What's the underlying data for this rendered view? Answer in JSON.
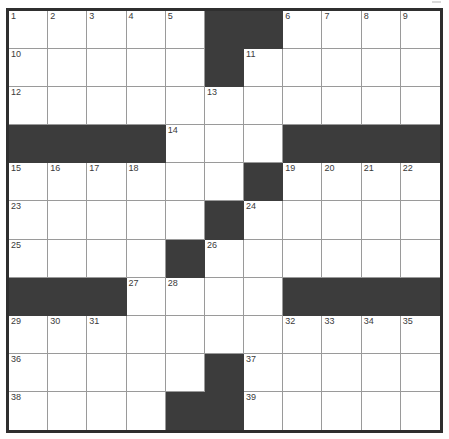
{
  "puzzle": {
    "title": "Crossword Grid",
    "columns": 11,
    "rows": 11,
    "colors": {
      "block": "#3c3c3c",
      "open": "#ffffff",
      "frame": "#2f2f2f",
      "gridline": "#9a9a9a",
      "number_text": "#3a3a3a"
    },
    "legend": {
      "block_label": "block",
      "open_label": "open"
    },
    "grid": [
      [
        {
          "type": "open",
          "number": "1"
        },
        {
          "type": "open",
          "number": "2"
        },
        {
          "type": "open",
          "number": "3"
        },
        {
          "type": "open",
          "number": "4"
        },
        {
          "type": "open",
          "number": "5"
        },
        {
          "type": "block",
          "number": ""
        },
        {
          "type": "block",
          "number": ""
        },
        {
          "type": "open",
          "number": "6"
        },
        {
          "type": "open",
          "number": "7"
        },
        {
          "type": "open",
          "number": "8"
        },
        {
          "type": "open",
          "number": "9"
        }
      ],
      [
        {
          "type": "open",
          "number": "10"
        },
        {
          "type": "open",
          "number": ""
        },
        {
          "type": "open",
          "number": ""
        },
        {
          "type": "open",
          "number": ""
        },
        {
          "type": "open",
          "number": ""
        },
        {
          "type": "block",
          "number": ""
        },
        {
          "type": "open",
          "number": "11"
        },
        {
          "type": "open",
          "number": ""
        },
        {
          "type": "open",
          "number": ""
        },
        {
          "type": "open",
          "number": ""
        },
        {
          "type": "open",
          "number": ""
        }
      ],
      [
        {
          "type": "open",
          "number": "12"
        },
        {
          "type": "open",
          "number": ""
        },
        {
          "type": "open",
          "number": ""
        },
        {
          "type": "open",
          "number": ""
        },
        {
          "type": "open",
          "number": ""
        },
        {
          "type": "open",
          "number": "13"
        },
        {
          "type": "open",
          "number": ""
        },
        {
          "type": "open",
          "number": ""
        },
        {
          "type": "open",
          "number": ""
        },
        {
          "type": "open",
          "number": ""
        },
        {
          "type": "open",
          "number": ""
        }
      ],
      [
        {
          "type": "block",
          "number": ""
        },
        {
          "type": "block",
          "number": ""
        },
        {
          "type": "block",
          "number": ""
        },
        {
          "type": "block",
          "number": ""
        },
        {
          "type": "open",
          "number": "14"
        },
        {
          "type": "open",
          "number": ""
        },
        {
          "type": "open",
          "number": ""
        },
        {
          "type": "block",
          "number": ""
        },
        {
          "type": "block",
          "number": ""
        },
        {
          "type": "block",
          "number": ""
        },
        {
          "type": "block",
          "number": ""
        }
      ],
      [
        {
          "type": "open",
          "number": "15"
        },
        {
          "type": "open",
          "number": "16"
        },
        {
          "type": "open",
          "number": "17"
        },
        {
          "type": "open",
          "number": "18"
        },
        {
          "type": "open",
          "number": ""
        },
        {
          "type": "open",
          "number": ""
        },
        {
          "type": "block",
          "number": ""
        },
        {
          "type": "open",
          "number": "19"
        },
        {
          "type": "open",
          "number": "20"
        },
        {
          "type": "open",
          "number": "21"
        },
        {
          "type": "open",
          "number": "22"
        }
      ],
      [
        {
          "type": "open",
          "number": "23"
        },
        {
          "type": "open",
          "number": ""
        },
        {
          "type": "open",
          "number": ""
        },
        {
          "type": "open",
          "number": ""
        },
        {
          "type": "open",
          "number": ""
        },
        {
          "type": "block",
          "number": ""
        },
        {
          "type": "open",
          "number": "24"
        },
        {
          "type": "open",
          "number": ""
        },
        {
          "type": "open",
          "number": ""
        },
        {
          "type": "open",
          "number": ""
        },
        {
          "type": "open",
          "number": ""
        }
      ],
      [
        {
          "type": "open",
          "number": "25"
        },
        {
          "type": "open",
          "number": ""
        },
        {
          "type": "open",
          "number": ""
        },
        {
          "type": "open",
          "number": ""
        },
        {
          "type": "block",
          "number": ""
        },
        {
          "type": "open",
          "number": "26"
        },
        {
          "type": "open",
          "number": ""
        },
        {
          "type": "open",
          "number": ""
        },
        {
          "type": "open",
          "number": ""
        },
        {
          "type": "open",
          "number": ""
        },
        {
          "type": "open",
          "number": ""
        }
      ],
      [
        {
          "type": "block",
          "number": ""
        },
        {
          "type": "block",
          "number": ""
        },
        {
          "type": "block",
          "number": ""
        },
        {
          "type": "open",
          "number": "27"
        },
        {
          "type": "open",
          "number": "28"
        },
        {
          "type": "open",
          "number": ""
        },
        {
          "type": "open",
          "number": ""
        },
        {
          "type": "block",
          "number": ""
        },
        {
          "type": "block",
          "number": ""
        },
        {
          "type": "block",
          "number": ""
        },
        {
          "type": "block",
          "number": ""
        }
      ],
      [
        {
          "type": "open",
          "number": "29"
        },
        {
          "type": "open",
          "number": "30"
        },
        {
          "type": "open",
          "number": "31"
        },
        {
          "type": "open",
          "number": ""
        },
        {
          "type": "open",
          "number": ""
        },
        {
          "type": "open",
          "number": ""
        },
        {
          "type": "open",
          "number": ""
        },
        {
          "type": "open",
          "number": "32"
        },
        {
          "type": "open",
          "number": "33"
        },
        {
          "type": "open",
          "number": "34"
        },
        {
          "type": "open",
          "number": "35"
        }
      ],
      [
        {
          "type": "open",
          "number": "36"
        },
        {
          "type": "open",
          "number": ""
        },
        {
          "type": "open",
          "number": ""
        },
        {
          "type": "open",
          "number": ""
        },
        {
          "type": "open",
          "number": ""
        },
        {
          "type": "block",
          "number": ""
        },
        {
          "type": "open",
          "number": "37"
        },
        {
          "type": "open",
          "number": ""
        },
        {
          "type": "open",
          "number": ""
        },
        {
          "type": "open",
          "number": ""
        },
        {
          "type": "open",
          "number": ""
        }
      ],
      [
        {
          "type": "open",
          "number": "38"
        },
        {
          "type": "open",
          "number": ""
        },
        {
          "type": "open",
          "number": ""
        },
        {
          "type": "open",
          "number": ""
        },
        {
          "type": "block",
          "number": ""
        },
        {
          "type": "block",
          "number": ""
        },
        {
          "type": "open",
          "number": "39"
        },
        {
          "type": "open",
          "number": ""
        },
        {
          "type": "open",
          "number": ""
        },
        {
          "type": "open",
          "number": ""
        },
        {
          "type": "open",
          "number": ""
        }
      ]
    ]
  }
}
